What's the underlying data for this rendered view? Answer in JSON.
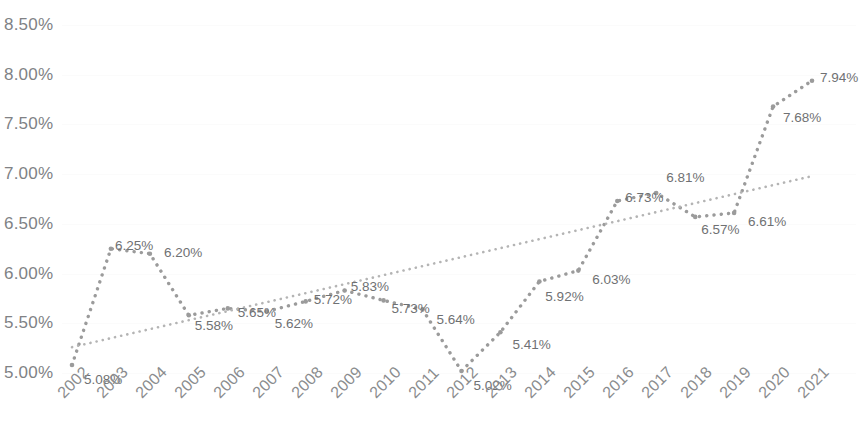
{
  "chart_data": {
    "type": "line",
    "title": "",
    "subtitle": "",
    "xlabel": "",
    "ylabel": "",
    "ylim": [
      5.0,
      8.5
    ],
    "ytick_labels": [
      "8.50%",
      "8.00%",
      "7.50%",
      "7.00%",
      "6.50%",
      "6.00%",
      "5.50%",
      "5.00%"
    ],
    "ytick_values": [
      8.5,
      8.0,
      7.5,
      7.0,
      6.5,
      6.0,
      5.5,
      5.0
    ],
    "grid": true,
    "legend": "none",
    "categories": [
      "2002",
      "2003",
      "2004",
      "2005",
      "2006",
      "2007",
      "2008",
      "2009",
      "2010",
      "2011",
      "2012",
      "2013",
      "2014",
      "2015",
      "2016",
      "2017",
      "2018",
      "2019",
      "2020",
      "2021"
    ],
    "values": [
      5.08,
      6.25,
      6.2,
      5.58,
      5.65,
      5.62,
      5.72,
      5.83,
      5.73,
      5.64,
      5.02,
      5.41,
      5.92,
      6.03,
      6.73,
      6.81,
      6.57,
      6.61,
      7.68,
      7.94
    ],
    "point_labels": [
      "5.08%",
      "6.25%",
      "6.20%",
      "5.58%",
      "5.65%",
      "5.62%",
      "5.72%",
      "5.83%",
      "5.73%",
      "5.64%",
      "5.02%",
      "5.41%",
      "5.92%",
      "6.03%",
      "6.73%",
      "6.81%",
      "6.57%",
      "6.61%",
      "7.68%",
      "7.94%"
    ],
    "series": [
      {
        "name": "series-1",
        "style": "dotted",
        "color": "#9b9b9b",
        "values": [
          5.08,
          6.25,
          6.2,
          5.58,
          5.65,
          5.62,
          5.72,
          5.83,
          5.73,
          5.64,
          5.02,
          5.41,
          5.92,
          6.03,
          6.73,
          6.81,
          6.57,
          6.61,
          7.68,
          7.94
        ]
      },
      {
        "name": "trendline",
        "style": "dotted",
        "color": "#b4b4b4",
        "type": "linear",
        "endpoints": [
          5.26,
          6.98
        ]
      }
    ]
  },
  "axis": {
    "y_labels": [
      "8.50%",
      "8.00%",
      "7.50%",
      "7.00%",
      "6.50%",
      "6.00%",
      "5.50%",
      "5.00%"
    ],
    "x_labels": [
      "2002",
      "2003",
      "2004",
      "2005",
      "2006",
      "2007",
      "2008",
      "2009",
      "2010",
      "2011",
      "2012",
      "2013",
      "2014",
      "2015",
      "2016",
      "2017",
      "2018",
      "2019",
      "2020",
      "2021"
    ]
  },
  "colors": {
    "series": "#9b9b9b",
    "trend": "#b4b4b4",
    "grid": "#fbfbfb",
    "text": "#808285",
    "label_text": "#6f7173",
    "background": "#ffffff"
  }
}
